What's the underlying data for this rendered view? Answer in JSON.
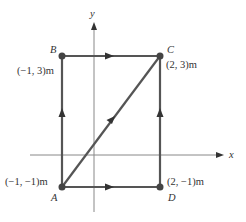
{
  "diagram": {
    "axes": {
      "x_label": "x",
      "y_label": "y"
    },
    "points": [
      {
        "name": "A",
        "coord": "(−1, −1)m",
        "x": -1,
        "y": -1
      },
      {
        "name": "B",
        "coord": "(−1, 3)m",
        "x": -1,
        "y": 3
      },
      {
        "name": "C",
        "coord": "(2, 3)m",
        "x": 2,
        "y": 3
      },
      {
        "name": "D",
        "coord": "(2, −1)m",
        "x": 2,
        "y": -1
      }
    ],
    "paths": [
      {
        "from": "A",
        "to": "B"
      },
      {
        "from": "B",
        "to": "C"
      },
      {
        "from": "A",
        "to": "C"
      },
      {
        "from": "A",
        "to": "D"
      },
      {
        "from": "D",
        "to": "C"
      }
    ],
    "colors": {
      "path": "#555555",
      "axis": "#777777",
      "point": "#444444"
    }
  }
}
